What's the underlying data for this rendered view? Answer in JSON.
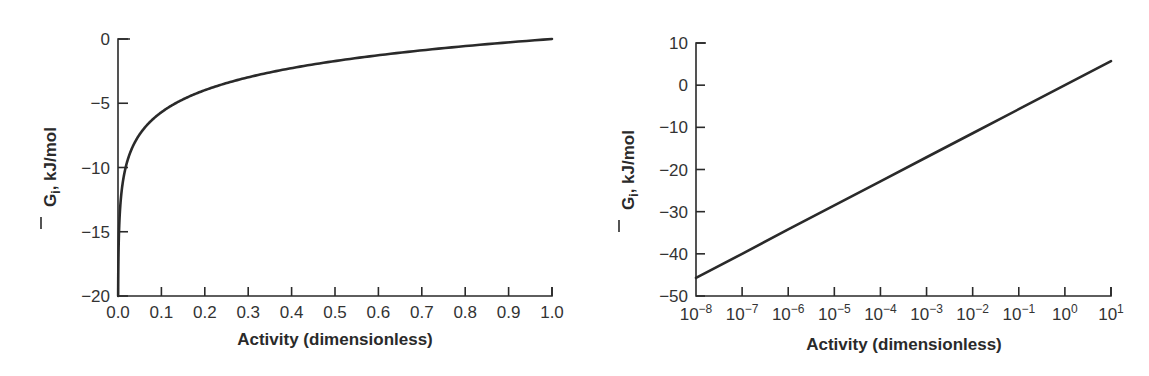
{
  "chart_data": [
    {
      "type": "line",
      "title": "",
      "xlabel": "Activity (dimensionless)",
      "ylabel": "Ḡi, kJ/mol",
      "ylabel_parts": {
        "symbol": "G",
        "subscript": "i",
        "rest": ", kJ/mol"
      },
      "xlim": [
        0.0,
        1.0
      ],
      "ylim": [
        -20,
        0
      ],
      "x_scale": "linear",
      "grid": false,
      "legend": null,
      "xticks": [
        "0.0",
        "0.1",
        "0.2",
        "0.3",
        "0.4",
        "0.5",
        "0.6",
        "0.7",
        "0.8",
        "0.9",
        "1.0"
      ],
      "yticks": [
        "0",
        "−5",
        "−10",
        "−15",
        "−20"
      ],
      "series": [
        {
          "name": "Ḡi = RT ln a",
          "x": [
            0.0003,
            0.001,
            0.005,
            0.01,
            0.02,
            0.05,
            0.1,
            0.15,
            0.2,
            0.3,
            0.4,
            0.5,
            0.6,
            0.7,
            0.8,
            0.9,
            1.0
          ],
          "y": [
            -20.0,
            -17.1,
            -13.1,
            -11.4,
            -9.7,
            -7.4,
            -5.7,
            -4.7,
            -4.0,
            -3.0,
            -2.3,
            -1.7,
            -1.3,
            -0.9,
            -0.6,
            -0.3,
            0.0
          ]
        }
      ]
    },
    {
      "type": "line",
      "title": "",
      "xlabel": "Activity (dimensionless)",
      "ylabel": "Ḡi, kJ/mol",
      "ylabel_parts": {
        "symbol": "G",
        "subscript": "i",
        "rest": ", kJ/mol"
      },
      "xlim": [
        "1e-8",
        "1e1"
      ],
      "ylim": [
        -50,
        10
      ],
      "x_scale": "log",
      "grid": false,
      "legend": null,
      "xticks": [
        {
          "base": "10",
          "exp": "−8"
        },
        {
          "base": "10",
          "exp": "−7"
        },
        {
          "base": "10",
          "exp": "−6"
        },
        {
          "base": "10",
          "exp": "−5"
        },
        {
          "base": "10",
          "exp": "−4"
        },
        {
          "base": "10",
          "exp": "−3"
        },
        {
          "base": "10",
          "exp": "−2"
        },
        {
          "base": "10",
          "exp": "−1"
        },
        {
          "base": "10",
          "exp": "0"
        },
        {
          "base": "10",
          "exp": "1"
        }
      ],
      "yticks": [
        "10",
        "0",
        "−10",
        "−20",
        "−30",
        "−40",
        "−50"
      ],
      "series": [
        {
          "name": "Ḡi = RT ln a",
          "x": [
            1e-08,
            1e-07,
            1e-06,
            1e-05,
            0.0001,
            0.001,
            0.01,
            0.1,
            1,
            10
          ],
          "y": [
            -45.7,
            -40.0,
            -34.2,
            -28.5,
            -22.8,
            -17.1,
            -11.4,
            -5.7,
            0.0,
            5.7
          ]
        }
      ]
    }
  ]
}
